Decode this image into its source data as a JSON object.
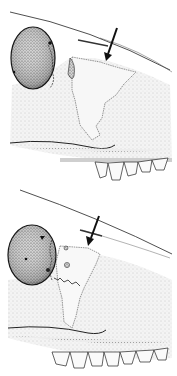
{
  "figure": {
    "colors": {
      "background": "#ffffff",
      "ink": "#1a1a1a",
      "stipple_dark": "#5a5a5a",
      "stipple_light": "#d8d8d8"
    },
    "panels": [
      {
        "id": "top",
        "arrow": "pointing down-left to suture"
      },
      {
        "id": "bottom",
        "arrow": "pointing down-left to suture"
      }
    ]
  }
}
